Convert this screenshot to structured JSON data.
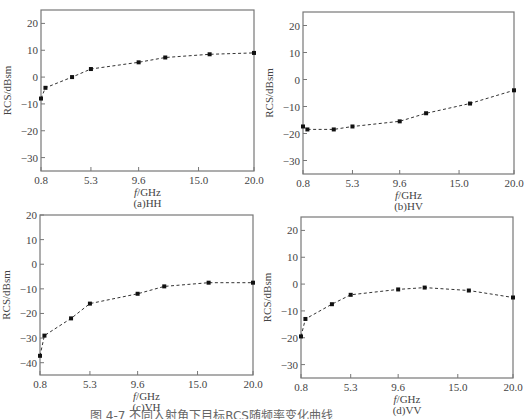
{
  "figure_caption": "图 4-7  不同入射角下目标RCS随频率变化曲线",
  "chart_data": [
    {
      "type": "line",
      "title": "(a)HH",
      "xlabel": "f/GHz",
      "ylabel": "RCS/dBsm",
      "x_ticks": [
        "0.8",
        "5.3",
        "9.6",
        "15.0",
        "20.0"
      ],
      "y_ticks": [
        20,
        10,
        0,
        -10,
        -20,
        -30
      ],
      "xlim": [
        0.8,
        20.0
      ],
      "ylim": [
        -35,
        25
      ],
      "grid": false,
      "line_style": "dashed",
      "marker": "square",
      "x": [
        0.8,
        1.2,
        3.6,
        5.3,
        9.6,
        12.0,
        16.0,
        20.0
      ],
      "values": [
        -8,
        -4,
        0,
        3,
        5.5,
        7.3,
        8.5,
        9
      ]
    },
    {
      "type": "line",
      "title": "(b)HV",
      "xlabel": "f/GHz",
      "ylabel": "RCS/dBsm",
      "x_ticks": [
        "0.8",
        "5.3",
        "9.6",
        "15.0",
        "20.0"
      ],
      "y_ticks": [
        20,
        10,
        0,
        -10,
        -20,
        -30
      ],
      "xlim": [
        0.8,
        20.0
      ],
      "ylim": [
        -35,
        25
      ],
      "grid": false,
      "line_style": "dashed",
      "marker": "square",
      "x": [
        0.8,
        1.2,
        3.6,
        5.3,
        9.6,
        12.0,
        16.0,
        20.0
      ],
      "values": [
        -17.4,
        -18.5,
        -18.5,
        -17.4,
        -15.5,
        -12.5,
        -8.9,
        -4
      ]
    },
    {
      "type": "line",
      "title": "(c)VH",
      "xlabel": "f/GHz",
      "ylabel": "RCS/dBsm",
      "x_ticks": [
        "0.8",
        "5.3",
        "9.6",
        "15.0",
        "20.0"
      ],
      "y_ticks": [
        20,
        10,
        0,
        -10,
        -20,
        -30,
        -40
      ],
      "xlim": [
        0.8,
        20.0
      ],
      "ylim": [
        -45,
        20
      ],
      "grid": false,
      "line_style": "dashed",
      "marker": "square",
      "x": [
        0.8,
        1.2,
        3.6,
        5.3,
        9.6,
        12.0,
        16.0,
        20.0
      ],
      "values": [
        -37.2,
        -29,
        -22,
        -16,
        -12,
        -9,
        -7.5,
        -7.5
      ]
    },
    {
      "type": "line",
      "title": "(d)VV",
      "xlabel": "f/GHz",
      "ylabel": "RCS/dBsm",
      "x_ticks": [
        "0.8",
        "5.3",
        "9.6",
        "15.0",
        "20.0"
      ],
      "y_ticks": [
        20,
        10,
        0,
        -10,
        -20,
        -30
      ],
      "xlim": [
        0.8,
        20.0
      ],
      "ylim": [
        -35,
        25
      ],
      "grid": false,
      "line_style": "dashed",
      "marker": "square",
      "x": [
        0.8,
        1.2,
        3.6,
        5.3,
        9.6,
        12.0,
        16.0,
        20.0
      ],
      "values": [
        -19.5,
        -13,
        -7.5,
        -4,
        -2,
        -1.3,
        -2.4,
        -5
      ]
    }
  ],
  "layout": {
    "panels": [
      {
        "left": 41,
        "top": 10,
        "right": 254,
        "bottom": 171
      },
      {
        "left": 303,
        "top": 12,
        "right": 514,
        "bottom": 174
      },
      {
        "left": 40,
        "top": 215,
        "right": 253,
        "bottom": 375
      },
      {
        "left": 301,
        "top": 217,
        "right": 513,
        "bottom": 378
      }
    ],
    "colors": {
      "axis": "#777777",
      "line": "#333333",
      "marker": "#111111",
      "text": "#444444"
    }
  }
}
